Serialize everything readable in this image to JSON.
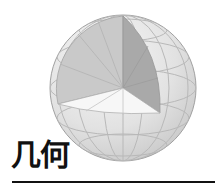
{
  "title": "几何",
  "illustration": {
    "subject": "sphere-with-octant-cutaway",
    "colors": {
      "sphere_fill": "#e4e4e4",
      "sphere_shade": "#cfcfcf",
      "grid_line": "#b4b4b4",
      "left_wall": "#c9c9c9",
      "right_wall": "#a9a9a9",
      "floor": "#f7f7f7",
      "outline": "#9a9a9a"
    }
  },
  "rule_color": "#111111"
}
